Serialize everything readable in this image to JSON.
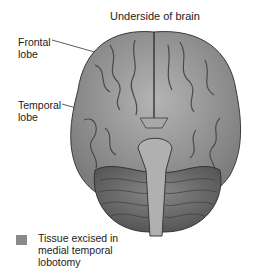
{
  "diagram": {
    "title": "Underside of brain",
    "labels": [
      {
        "text_line1": "Frontal",
        "text_line2": "lobe"
      },
      {
        "text_line1": "Temporal",
        "text_line2": "lobe"
      }
    ],
    "legend": {
      "swatch_color": "#8a8a8a",
      "line1": "Tissue excised in",
      "line2": "medial temporal",
      "line3": "lobotomy"
    },
    "colors": {
      "cortex": "#9a9a9a",
      "sulci": "#4a4a4a",
      "cerebellum": "#6e6e6e",
      "brainstem": "#b0b0b0"
    }
  }
}
